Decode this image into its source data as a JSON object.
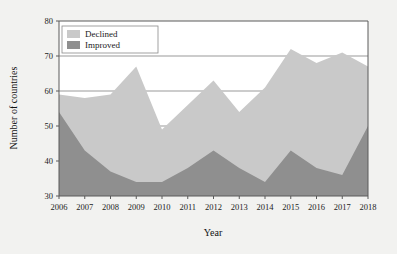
{
  "chart_data": {
    "type": "area",
    "title": "",
    "subtitle": "",
    "xlabel": "Year",
    "ylabel": "Number of countries",
    "categories": [
      "2006",
      "2007",
      "2008",
      "2009",
      "2010",
      "2011",
      "2012",
      "2013",
      "2014",
      "2015",
      "2016",
      "2017",
      "2018"
    ],
    "x": [
      2006,
      2007,
      2008,
      2009,
      2010,
      2011,
      2012,
      2013,
      2014,
      2015,
      2016,
      2017,
      2018
    ],
    "stacked": true,
    "series": [
      {
        "name": "Improved",
        "color": "#8f8f8f",
        "values": [
          54,
          43,
          37,
          34,
          34,
          38,
          43,
          38,
          34,
          43,
          38,
          36,
          50
        ]
      },
      {
        "name": "Declined",
        "color": "#c9c9c9",
        "values": [
          5,
          15,
          22,
          33,
          15,
          18,
          20,
          16,
          27,
          29,
          30,
          35,
          17
        ]
      }
    ],
    "totals": [
      59,
      58,
      59,
      67,
      49,
      56,
      63,
      54,
      61,
      72,
      68,
      71,
      67
    ],
    "xlim": [
      2006,
      2018
    ],
    "ylim": [
      30,
      80
    ],
    "yticks": [
      30,
      40,
      50,
      60,
      70,
      80
    ],
    "ytick_labels": [
      "30",
      "40",
      "50",
      "60",
      "70",
      "80"
    ],
    "xticks": [
      2006,
      2007,
      2008,
      2009,
      2010,
      2011,
      2012,
      2013,
      2014,
      2015,
      2016,
      2017,
      2018
    ],
    "xtick_labels": [
      "2006",
      "2007",
      "2008",
      "2009",
      "2010",
      "2011",
      "2012",
      "2013",
      "2014",
      "2015",
      "2016",
      "2017",
      "2018"
    ],
    "grid": "horizontal",
    "legend_position": "top-left",
    "legend": [
      {
        "label": "Declined",
        "color": "#c9c9c9"
      },
      {
        "label": "Improved",
        "color": "#8f8f8f"
      }
    ],
    "background_color": "#f2f2f0",
    "plot_background_color": "#ffffff",
    "axis_color": "#5a5a5a"
  },
  "axes": {
    "y_title": "Number of countries",
    "x_title": "Year"
  },
  "legend": {
    "items": [
      {
        "label": "Declined"
      },
      {
        "label": "Improved"
      }
    ]
  }
}
